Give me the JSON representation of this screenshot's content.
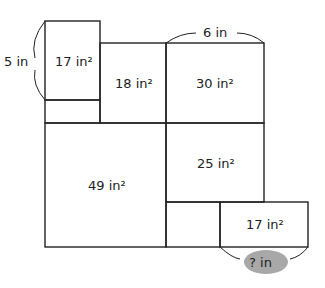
{
  "diagram": {
    "regions": [
      {
        "id": "top-left",
        "label": "17 in²"
      },
      {
        "id": "top-middle",
        "label": "18 in²"
      },
      {
        "id": "top-right",
        "label": "30 in²"
      },
      {
        "id": "bottom-left",
        "label": "49 in²"
      },
      {
        "id": "middle-right",
        "label": "25 in²"
      },
      {
        "id": "bottom-right",
        "label": "17 in²"
      }
    ],
    "dimensions": {
      "left_height": "5 in",
      "top_width": "6 in",
      "unknown_width": "? in"
    },
    "colors": {
      "stroke": "#222222",
      "unknown_highlight": "#a8a8a8"
    }
  }
}
